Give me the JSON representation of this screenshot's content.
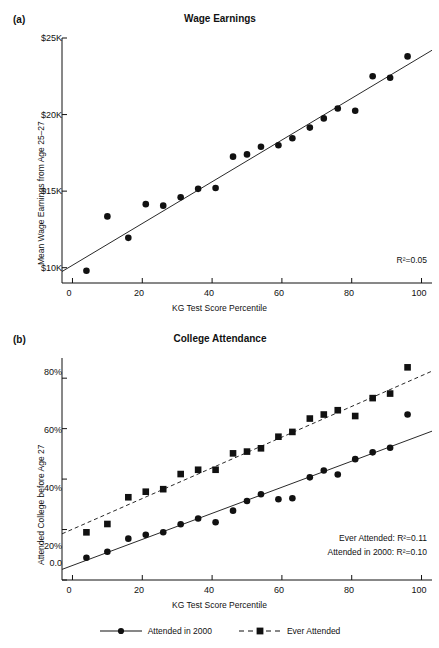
{
  "figure": {
    "width": 439,
    "height": 648,
    "background": "#ffffff",
    "ink": "#111111"
  },
  "panels": [
    {
      "letter": "(a)",
      "title": "Wage Earnings",
      "xlabel": "KG Test Score Percentile",
      "ylabel": "Mean Wage Earnings from Age 25–27",
      "annotation": "R²=0.05"
    },
    {
      "letter": "(b)",
      "title": "College Attendance",
      "xlabel": "KG Test Score Percentile",
      "ylabel": "Attended College before Age 27",
      "annotation_line1": "Ever Attended: R²=0.11",
      "annotation_line2": "Attended in 2000: R²=0.10"
    }
  ],
  "legend": {
    "position": "bottom-center",
    "items": [
      {
        "label": "Attended in 2000",
        "marker": "circle",
        "line": "solid"
      },
      {
        "label": "Ever Attended",
        "marker": "square",
        "line": "dashed"
      }
    ]
  },
  "chart_data": [
    {
      "type": "scatter",
      "panel": "(a)",
      "title": "Wage Earnings",
      "xlabel": "KG Test Score Percentile",
      "ylabel": "Mean Wage Earnings from Age 25–27",
      "xlim": [
        -3,
        103
      ],
      "ylim": [
        9000,
        25000
      ],
      "xticks": [
        0,
        20,
        40,
        60,
        80,
        100
      ],
      "xticklabels": [
        "0",
        "20",
        "40",
        "60",
        "80",
        "100"
      ],
      "yticks": [
        10000,
        15000,
        20000,
        25000
      ],
      "yticklabels": [
        "$10K",
        "$15K",
        "$20K",
        "$25K"
      ],
      "grid": false,
      "legend": "none",
      "annotations": [
        "R²=0.05"
      ],
      "series": [
        {
          "name": "Mean Wage Earnings",
          "marker": "circle",
          "x": [
            4,
            10,
            16,
            21,
            26,
            31,
            36,
            41,
            46,
            50,
            54,
            59,
            63,
            68,
            72,
            76,
            81,
            86,
            91,
            96
          ],
          "y": [
            9800,
            13350,
            11950,
            14150,
            14050,
            14600,
            15150,
            15200,
            17250,
            17400,
            17900,
            18000,
            18450,
            19150,
            19750,
            20400,
            20250,
            22500,
            22400,
            23800
          ]
        }
      ],
      "fit_lines": [
        {
          "name": "OLS fit",
          "style": "solid",
          "x": [
            -3,
            103
          ],
          "y": [
            9750,
            24200
          ]
        }
      ]
    },
    {
      "type": "scatter",
      "panel": "(b)",
      "title": "College Attendance",
      "xlabel": "KG Test Score Percentile",
      "ylabel": "Attended College before Age 27",
      "xlim": [
        -3,
        103
      ],
      "ylim": [
        0,
        88
      ],
      "xticks": [
        0,
        20,
        40,
        60,
        80,
        100
      ],
      "xticklabels": [
        "0",
        "20",
        "40",
        "60",
        "80",
        "100"
      ],
      "yticks": [
        0,
        20,
        40,
        60,
        80
      ],
      "yticklabels": [
        "0.0",
        "20%",
        "40%",
        "60%",
        "80%"
      ],
      "grid": false,
      "legend": "bottom-center",
      "annotations": [
        "Ever Attended: R²=0.11",
        "Attended in 2000: R²=0.10"
      ],
      "series": [
        {
          "name": "Attended in 2000",
          "marker": "circle",
          "line": "solid",
          "x": [
            4,
            10,
            16,
            21,
            26,
            31,
            36,
            41,
            46,
            50,
            54,
            59,
            63,
            68,
            72,
            76,
            81,
            86,
            91,
            96
          ],
          "y": [
            8.8,
            11.2,
            16.4,
            17.9,
            18.9,
            22.1,
            24.4,
            22.9,
            27.5,
            31.3,
            34.0,
            32.0,
            32.4,
            40.7,
            43.4,
            41.8,
            47.9,
            50.6,
            52.4,
            65.6
          ]
        },
        {
          "name": "Ever Attended",
          "marker": "square",
          "line": "dashed",
          "x": [
            4,
            10,
            16,
            21,
            26,
            31,
            36,
            41,
            46,
            50,
            54,
            59,
            63,
            68,
            72,
            76,
            81,
            86,
            91,
            96
          ],
          "y": [
            18.9,
            22.2,
            32.8,
            35.0,
            36.0,
            42.0,
            43.7,
            43.7,
            50.2,
            50.9,
            52.2,
            56.8,
            58.7,
            64.0,
            65.6,
            67.3,
            65.0,
            72.1,
            73.9,
            84.3
          ]
        }
      ],
      "fit_lines": [
        {
          "name": "Attended in 2000 fit",
          "style": "solid",
          "x": [
            -3,
            103
          ],
          "y": [
            4.2,
            59.0
          ]
        },
        {
          "name": "Ever Attended fit",
          "style": "dashed",
          "x": [
            -3,
            103
          ],
          "y": [
            18.3,
            82.8
          ]
        }
      ]
    }
  ]
}
